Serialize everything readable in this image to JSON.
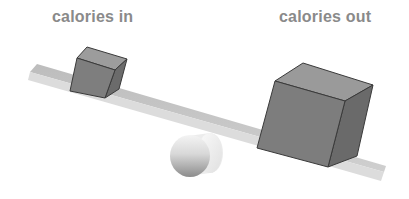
{
  "labels": {
    "left": "calories in",
    "right": "calories out"
  },
  "diagram": {
    "type": "seesaw-balance",
    "fulcrum": "cylinder",
    "left_weight": {
      "label": "calories in",
      "relative_size": "small"
    },
    "right_weight": {
      "label": "calories out",
      "relative_size": "large"
    },
    "tilt": "down-right"
  },
  "colors": {
    "label_text": "#8a8a8a",
    "cube_front": "#7d7d7d",
    "cube_top": "#9a9a9a",
    "cube_side": "#6a6a6a",
    "plank_top": "#c4c4c4",
    "plank_edge": "#dadada",
    "cylinder_light": "#f2f2f2",
    "cylinder_dark": "#8c8c8c"
  }
}
